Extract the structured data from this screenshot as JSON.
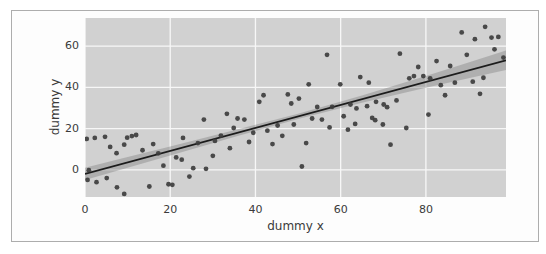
{
  "figure": {
    "xlabel": "dummy x",
    "ylabel": "dummy y"
  },
  "colors": {
    "page_bg": "#ffffff",
    "frame_border": "#adadad",
    "figure_bg": "#fdfdfd",
    "axes_bg": "#d1d1d1",
    "gridline": "#f7f7f7",
    "point": "#3d3d3d",
    "regression_line": "#1c1c1c",
    "confidence_band": "#808080",
    "text": "#3a3a3a"
  },
  "chart_data": {
    "type": "scatter",
    "title": "",
    "xlabel": "dummy x",
    "ylabel": "dummy y",
    "xlim": [
      0,
      98.8
    ],
    "ylim": [
      -13.2,
      73.7
    ],
    "xticks": [
      0,
      20,
      40,
      60,
      80
    ],
    "yticks": [
      0,
      20,
      40,
      60
    ],
    "grid": true,
    "legend": false,
    "points": [
      [
        0.4,
        15.0
      ],
      [
        2.3,
        15.5
      ],
      [
        4.7,
        16.0
      ],
      [
        5.9,
        11.1
      ],
      [
        7.4,
        8.1
      ],
      [
        9.2,
        12.2
      ],
      [
        9.9,
        15.6
      ],
      [
        11.0,
        16.4
      ],
      [
        12.0,
        16.9
      ],
      [
        0.9,
        -0.2
      ],
      [
        0.6,
        -4.9
      ],
      [
        2.7,
        -6.0
      ],
      [
        5.1,
        -4.0
      ],
      [
        7.5,
        -8.5
      ],
      [
        9.2,
        -11.7
      ],
      [
        13.5,
        9.5
      ],
      [
        15.1,
        -8.1
      ],
      [
        16.0,
        12.5
      ],
      [
        17.2,
        8.0
      ],
      [
        18.4,
        2.0
      ],
      [
        19.6,
        -7.0
      ],
      [
        20.5,
        -7.3
      ],
      [
        21.4,
        6.0
      ],
      [
        22.7,
        4.9
      ],
      [
        23.0,
        15.5
      ],
      [
        24.5,
        -3.3
      ],
      [
        25.4,
        0.8
      ],
      [
        26.5,
        13.0
      ],
      [
        27.9,
        24.4
      ],
      [
        28.4,
        0.5
      ],
      [
        30.0,
        6.8
      ],
      [
        30.5,
        14.0
      ],
      [
        31.9,
        16.6
      ],
      [
        33.3,
        27.2
      ],
      [
        34.0,
        10.5
      ],
      [
        34.9,
        20.3
      ],
      [
        35.8,
        24.9
      ],
      [
        37.4,
        24.4
      ],
      [
        38.5,
        13.5
      ],
      [
        39.5,
        18.0
      ],
      [
        40.9,
        33.0
      ],
      [
        41.9,
        36.2
      ],
      [
        42.8,
        19.0
      ],
      [
        44.0,
        12.5
      ],
      [
        45.2,
        21.5
      ],
      [
        46.3,
        16.5
      ],
      [
        47.6,
        36.6
      ],
      [
        48.4,
        32.2
      ],
      [
        49.0,
        22.0
      ],
      [
        50.2,
        34.6
      ],
      [
        50.9,
        1.6
      ],
      [
        51.9,
        13.0
      ],
      [
        52.5,
        41.5
      ],
      [
        53.3,
        24.9
      ],
      [
        54.5,
        30.5
      ],
      [
        55.6,
        24.4
      ],
      [
        56.8,
        55.8
      ],
      [
        57.4,
        20.6
      ],
      [
        58.0,
        30.6
      ],
      [
        59.9,
        41.5
      ],
      [
        60.7,
        26.0
      ],
      [
        61.7,
        19.5
      ],
      [
        62.3,
        31.7
      ],
      [
        63.4,
        22.3
      ],
      [
        63.7,
        29.8
      ],
      [
        64.6,
        45.0
      ],
      [
        66.2,
        30.9
      ],
      [
        66.6,
        42.3
      ],
      [
        67.4,
        25.2
      ],
      [
        68.1,
        24.1
      ],
      [
        68.3,
        33.0
      ],
      [
        69.9,
        22.0
      ],
      [
        70.1,
        31.7
      ],
      [
        70.9,
        30.4
      ],
      [
        71.7,
        12.2
      ],
      [
        73.1,
        33.7
      ],
      [
        73.9,
        56.4
      ],
      [
        75.4,
        20.3
      ],
      [
        76.1,
        44.4
      ],
      [
        77.2,
        45.5
      ],
      [
        78.2,
        49.9
      ],
      [
        79.4,
        45.5
      ],
      [
        80.6,
        26.8
      ],
      [
        81.0,
        44.4
      ],
      [
        82.5,
        52.8
      ],
      [
        83.5,
        41.1
      ],
      [
        84.5,
        36.2
      ],
      [
        85.7,
        50.4
      ],
      [
        86.8,
        42.3
      ],
      [
        88.4,
        66.7
      ],
      [
        89.6,
        55.8
      ],
      [
        91.0,
        42.8
      ],
      [
        91.5,
        63.4
      ],
      [
        92.7,
        36.9
      ],
      [
        93.5,
        44.7
      ],
      [
        93.9,
        69.4
      ],
      [
        95.4,
        64.2
      ],
      [
        96.1,
        58.5
      ],
      [
        97.0,
        64.5
      ],
      [
        98.2,
        54.5
      ]
    ],
    "regression_line": {
      "x": [
        0,
        99
      ],
      "y": [
        -2.0,
        53.3
      ]
    },
    "confidence_band": {
      "x": [
        0,
        10,
        20,
        35,
        50,
        65,
        80,
        90,
        99
      ],
      "half_width": [
        3.0,
        2.6,
        2.2,
        1.6,
        1.3,
        1.8,
        2.8,
        3.8,
        4.8
      ]
    }
  }
}
